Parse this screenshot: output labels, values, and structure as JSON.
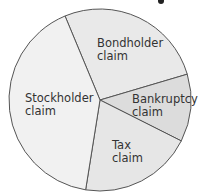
{
  "chart_data": {
    "type": "pie",
    "title": "",
    "center": [
      100,
      100
    ],
    "radius": 91,
    "start_angle_deg": 337.4,
    "stroke_color": "#555555",
    "slices": [
      {
        "label": "Bondholder claim",
        "lines": [
          "Bondholder",
          "claim"
        ],
        "value": 26.7,
        "color": "#e9e9e9",
        "label_pos": [
          97,
          47
        ]
      },
      {
        "label": "Bankruptcy claim",
        "lines": [
          "Bankruptcy",
          "claim"
        ],
        "value": 12.0,
        "color": "#dcdcdc",
        "label_pos": [
          132,
          103
        ]
      },
      {
        "label": "Tax claim",
        "lines": [
          "Tax",
          "claim"
        ],
        "value": 20.1,
        "color": "#e6e6e6",
        "label_pos": [
          112,
          149
        ]
      },
      {
        "label": "Stockholder claim",
        "lines": [
          "Stockholder",
          "claim"
        ],
        "value": 41.2,
        "color": "#f1f1f1",
        "label_pos": [
          25,
          102
        ]
      }
    ]
  }
}
